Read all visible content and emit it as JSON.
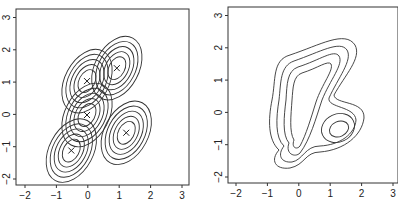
{
  "chart_data": [
    {
      "type": "contour",
      "title": "",
      "xlabel": "",
      "ylabel": "",
      "xlim": [
        -2.2,
        3.2
      ],
      "ylim": [
        -2.2,
        3.2
      ],
      "xticks": [
        "-2",
        "-1",
        "0",
        "1",
        "2",
        "3"
      ],
      "yticks": [
        "-2",
        "-1",
        "0",
        "1",
        "2",
        "3"
      ],
      "grid": false,
      "legend": null,
      "description": "Five individual bivariate Gaussian kernels, each with five concentric elliptical contours, centers marked with x",
      "centers": [
        {
          "x": -0.5,
          "y": -1.1
        },
        {
          "x": 0.0,
          "y": 0.0
        },
        {
          "x": 0.0,
          "y": 1.05
        },
        {
          "x": 0.95,
          "y": 1.45
        },
        {
          "x": 1.25,
          "y": -0.55
        }
      ],
      "contour_levels": 5,
      "marker": "x"
    },
    {
      "type": "contour",
      "title": "",
      "xlabel": "",
      "ylabel": "",
      "xlim": [
        -2.2,
        3.2
      ],
      "ylim": [
        -2.2,
        3.2
      ],
      "xticks": [
        "-2",
        "-1",
        "0",
        "1",
        "2",
        "3"
      ],
      "yticks": [
        "-2",
        "-1",
        "0",
        "1",
        "2",
        "3"
      ],
      "grid": false,
      "legend": null,
      "description": "Sum of the five kernels: kernel density estimate with four nested contours forming an elongated region plus a separate inner mode near (1.25, -0.6)",
      "contour_levels": 4,
      "secondary_mode": {
        "x": 1.25,
        "y": -0.6
      }
    }
  ],
  "panels": {
    "left": {
      "xticks": [
        "-2",
        "-1",
        "0",
        "1",
        "2",
        "3"
      ],
      "yticks": [
        "-2",
        "-1",
        "0",
        "1",
        "2",
        "3"
      ]
    },
    "right": {
      "xticks": [
        "-2",
        "-1",
        "0",
        "1",
        "2",
        "3"
      ],
      "yticks": [
        "-2",
        "-1",
        "0",
        "1",
        "2",
        "3"
      ]
    }
  }
}
